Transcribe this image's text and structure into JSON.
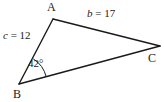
{
  "figure": {
    "type": "triangle-diagram",
    "background_color": "#ffffff",
    "stroke_color": "#1a1a1a",
    "vertices": {
      "A": {
        "label": "A",
        "x": 53,
        "y": 19
      },
      "B": {
        "label": "B",
        "x": 19,
        "y": 84
      },
      "C": {
        "label": "C",
        "x": 160,
        "y": 46
      }
    },
    "sides": {
      "b": {
        "text": "b = 17",
        "variable": "b",
        "equals": " = ",
        "value": "17",
        "between": "A-C"
      },
      "c": {
        "text": "c = 12",
        "variable": "c",
        "equals": " = ",
        "value": "12",
        "between": "A-B"
      }
    },
    "angles": {
      "B": {
        "text": "42°",
        "value": "42",
        "unit": "°",
        "at_vertex": "B",
        "arc_radius": 28
      }
    }
  }
}
